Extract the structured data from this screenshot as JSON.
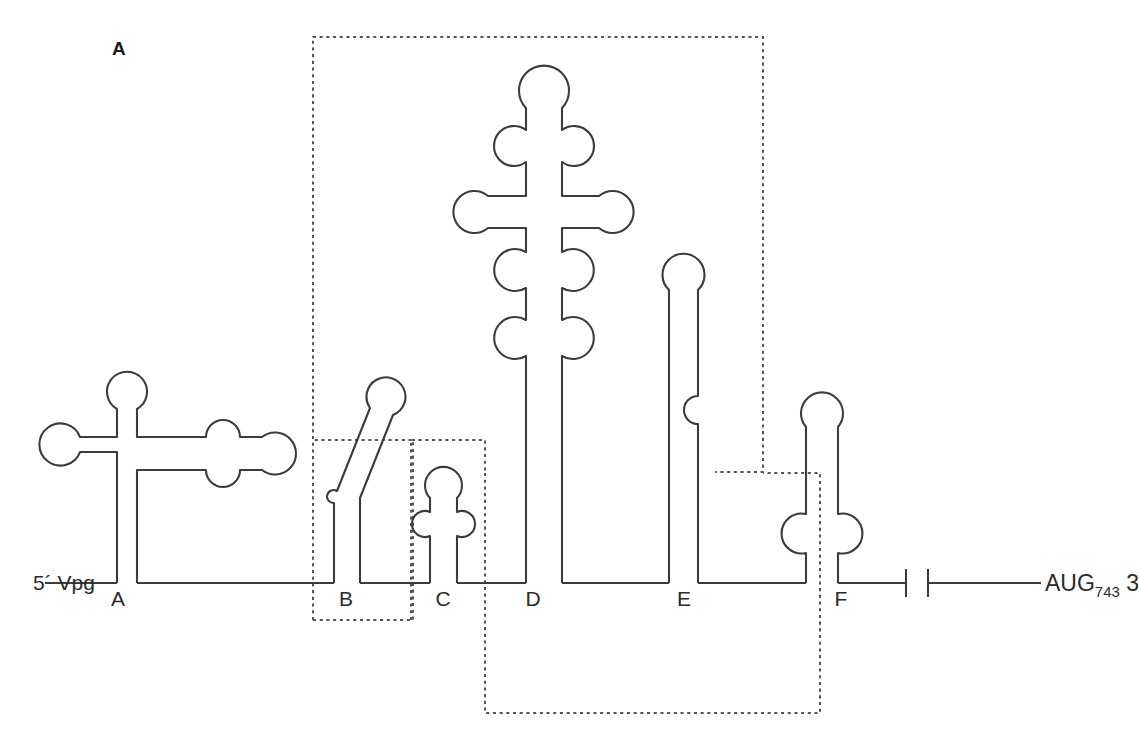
{
  "figure": {
    "panel_label": "A",
    "title_text": "",
    "stroke_color": "#3c3c3c",
    "box_color": "#555555",
    "background": "#ffffff"
  },
  "annotations": {
    "five_prime": "5´ Vpg",
    "start_codon": "AUG",
    "start_codon_position": "743",
    "three_prime": "3"
  },
  "domains": [
    {
      "id": "A",
      "label": "A",
      "label_x": 118,
      "label_y": 600,
      "description": "cloverleaf with left arm, apical loop and long right arm with internal bulge"
    },
    {
      "id": "B",
      "label": "B",
      "label_x": 346,
      "label_y": 600,
      "description": "slanted stem-loop with single-sided bulge near base"
    },
    {
      "id": "C",
      "label": "C",
      "label_x": 441,
      "label_y": 600,
      "description": "short stem-loop with apical loop and one internal loop"
    },
    {
      "id": "D",
      "label": "D",
      "label_x": 527,
      "label_y": 600,
      "description": "tall cruciform stem with apical loop, three internal loops and two side arms"
    },
    {
      "id": "E",
      "label": "E",
      "label_x": 680,
      "label_y": 600,
      "description": "tall stem-loop with apical loop and a right-side bulge"
    },
    {
      "id": "F",
      "label": "F",
      "label_x": 837,
      "label_y": 600,
      "description": "stem-loop with apical loop and symmetric internal loop near base"
    }
  ],
  "dotted_regions": [
    {
      "name": "oriI-region",
      "x": 313,
      "y": 37,
      "width": 450,
      "height": 435
    },
    {
      "name": "domain-b-region",
      "x": 313,
      "y": 440,
      "width": 100,
      "height": 180
    },
    {
      "name": "domain-c-region",
      "x": 411,
      "y": 440,
      "width": 74,
      "height": 180
    },
    {
      "name": "long-range-pairing-region",
      "x": 484,
      "y": 473,
      "width": 336,
      "height": 240
    }
  ]
}
